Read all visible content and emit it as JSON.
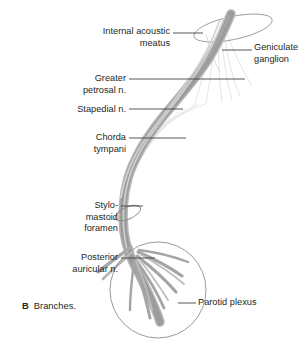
{
  "figure": {
    "caption_letter": "B",
    "caption_text": "Branches.",
    "background_color": "#ffffff",
    "text_color": "#231f20"
  },
  "colors": {
    "nerve_trunk": "#9c9c9c",
    "nerve_trunk_dark": "#8a8a8a",
    "nerve_branch": "#a8a8a8",
    "fiber_faint": "#d8d8d8",
    "outline": "#9a9a9a",
    "leader_line": "#3a3a3a"
  },
  "labels": {
    "internal_acoustic_meatus": {
      "line1": "Internal acoustic",
      "line2": "meatus",
      "align": "right"
    },
    "geniculate_ganglion": {
      "line1": "Geniculate",
      "line2": "ganglion",
      "align": "left"
    },
    "greater_petrosal": {
      "line1": "Greater",
      "line2": "petrosal n.",
      "align": "right"
    },
    "stapedial": {
      "line1": "Stapedial n.",
      "align": "right"
    },
    "chorda_tympani": {
      "line1": "Chorda",
      "line2": "tympani",
      "align": "right"
    },
    "stylomastoid_foramen": {
      "line1": "Stylo-",
      "line2": "mastoid",
      "line3": "foramen",
      "align": "right"
    },
    "posterior_auricular": {
      "line1": "Posterior",
      "line2": "auricular n.",
      "align": "right"
    },
    "parotid_plexus": {
      "line1": "Parotid plexus",
      "align": "left"
    }
  },
  "structures": {
    "internal_acoustic_meatus_opening": "ellipse-outline",
    "geniculate_ganglion_node": "nerve-bend",
    "stylomastoid_foramen_ring": "small-ellipse-outline",
    "parotid_plexus_circle": "circle-outline",
    "main_trunk": "facial-nerve-trunk"
  }
}
